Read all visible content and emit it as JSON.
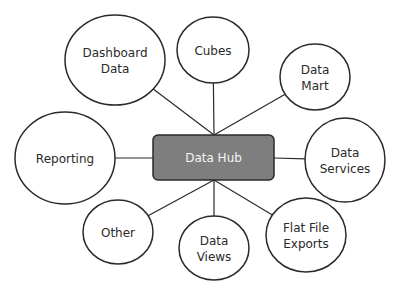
{
  "diagram": {
    "hub": {
      "label": "Data Hub",
      "fill": "#7e7e7e",
      "stroke": "#2a2a2a",
      "x": 153,
      "y": 135,
      "w": 121,
      "h": 45
    },
    "nodes": [
      {
        "id": "dashboard-data",
        "lines": [
          "Dashboard",
          "Data"
        ],
        "cx": 115,
        "cy": 60,
        "rx": 50,
        "ry": 45,
        "attach": [
          214,
          135
        ]
      },
      {
        "id": "cubes",
        "lines": [
          "Cubes"
        ],
        "cx": 213,
        "cy": 50,
        "rx": 36,
        "ry": 33,
        "attach": [
          214,
          135
        ]
      },
      {
        "id": "data-mart",
        "lines": [
          "Data",
          "Mart"
        ],
        "cx": 315,
        "cy": 77,
        "rx": 35,
        "ry": 33,
        "attach": [
          214,
          135
        ]
      },
      {
        "id": "reporting",
        "lines": [
          "Reporting"
        ],
        "cx": 65,
        "cy": 158,
        "rx": 50,
        "ry": 46,
        "attach": [
          153,
          158
        ]
      },
      {
        "id": "data-services",
        "lines": [
          "Data",
          "Services"
        ],
        "cx": 345,
        "cy": 160,
        "rx": 40,
        "ry": 42,
        "attach": [
          274,
          158
        ]
      },
      {
        "id": "other",
        "lines": [
          "Other"
        ],
        "cx": 118,
        "cy": 232,
        "rx": 35,
        "ry": 32,
        "attach": [
          214,
          180
        ]
      },
      {
        "id": "data-views",
        "lines": [
          "Data",
          "Views"
        ],
        "cx": 214,
        "cy": 248,
        "rx": 35,
        "ry": 32,
        "attach": [
          214,
          180
        ]
      },
      {
        "id": "flat-file-exports",
        "lines": [
          "Flat File",
          "Exports"
        ],
        "cx": 306,
        "cy": 235,
        "rx": 40,
        "ry": 37,
        "attach": [
          214,
          180
        ]
      }
    ],
    "colors": {
      "stroke": "#2a2a2a",
      "node_fill": "#ffffff",
      "text": "#2a2a2a",
      "hub_text": "#f4f4f4"
    }
  }
}
